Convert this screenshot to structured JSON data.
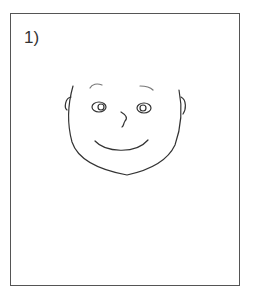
{
  "panel": {
    "label": "1)",
    "stroke_color": "#333333",
    "frame_color": "#555555",
    "subject": "smiling-face-drawing"
  }
}
